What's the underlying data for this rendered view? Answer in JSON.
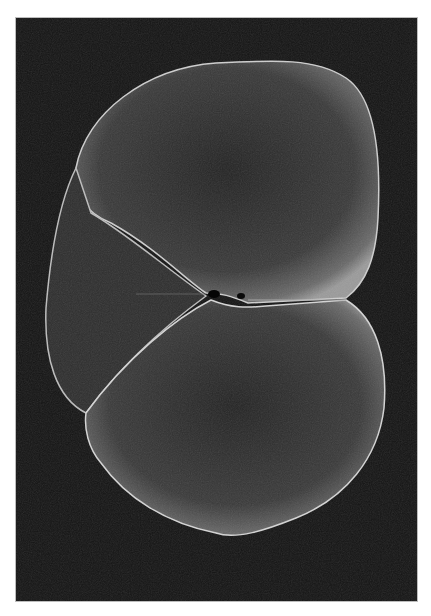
{
  "image": {
    "subject": "spinal-cord-cross-section",
    "background_color": "#141414",
    "tissue_color": "#2a2a2a",
    "edge_color": "#d8d8d8",
    "frame_border": "#bdbdbd"
  }
}
